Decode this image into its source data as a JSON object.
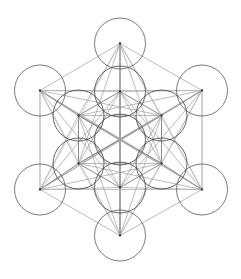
{
  "figure": {
    "type": "sacred-geometry-line-diagram",
    "background_color": "#ffffff",
    "canvas": {
      "width": 241,
      "height": 279
    },
    "center": {
      "x": 120,
      "y": 139.5
    },
    "stroke_colors": {
      "circle": "#4d4d4d",
      "inner_circle": "#3f3f3f",
      "line_dark": "#4a4a4a",
      "line_mid": "#8d8d8d",
      "line_faint": "#b9b9b9",
      "node": "#2b2b2b"
    },
    "radii": {
      "circle_radius": 25.5,
      "inner_ring_distance": 48,
      "outer_ring_distance": 96,
      "corner_ring_distance": 100
    },
    "counts": {
      "circles": 13,
      "inner_ring_circles": 6,
      "outer_ring_circles": 6,
      "center_circles": 1
    },
    "nodes": [
      {
        "name": "center",
        "x": 120,
        "y": 139.5
      },
      {
        "name": "inner-top",
        "x": 120,
        "y": 91.5
      },
      {
        "name": "inner-upper-right",
        "x": 161.5,
        "y": 115.5
      },
      {
        "name": "inner-lower-right",
        "x": 161.5,
        "y": 163.5
      },
      {
        "name": "inner-bottom",
        "x": 120,
        "y": 187.5
      },
      {
        "name": "inner-lower-left",
        "x": 78.5,
        "y": 163.5
      },
      {
        "name": "inner-upper-left",
        "x": 78.5,
        "y": 115.5
      },
      {
        "name": "outer-top",
        "x": 120,
        "y": 43.5
      },
      {
        "name": "outer-upper-right",
        "x": 202,
        "y": 90.5
      },
      {
        "name": "outer-lower-right",
        "x": 202,
        "y": 189.5
      },
      {
        "name": "outer-bottom",
        "x": 120,
        "y": 235.5
      },
      {
        "name": "outer-lower-left",
        "x": 40,
        "y": 189.5
      },
      {
        "name": "outer-upper-left",
        "x": 40,
        "y": 90.5
      }
    ]
  }
}
